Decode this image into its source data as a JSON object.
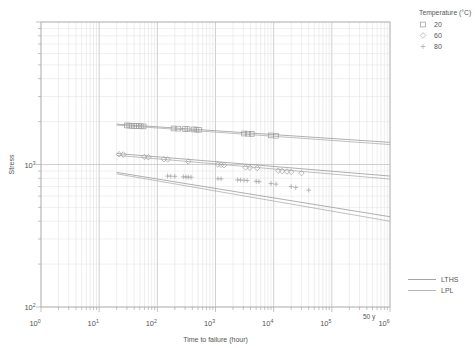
{
  "chart_data": {
    "type": "scatter",
    "title": "",
    "xlabel": "Time to failure (hour)",
    "ylabel": "Stress",
    "xscale": "log",
    "yscale": "log",
    "xlim": [
      1,
      1000000
    ],
    "ylim": [
      100,
      10000
    ],
    "xticks": [
      "10",
      "10",
      "10",
      "10",
      "10",
      "10",
      "10"
    ],
    "xtick_exponents": [
      "0",
      "1",
      "2",
      "3",
      "4",
      "5",
      "6"
    ],
    "yticks": [
      "10",
      "10"
    ],
    "ytick_exponents": [
      "2",
      "3"
    ],
    "grid": true,
    "legend_position": "top-right",
    "annotations": [
      {
        "text": "50 y",
        "x": 438000,
        "y": 100
      }
    ],
    "legend": {
      "title": "Temperature (°C)",
      "entries": [
        {
          "label": "20",
          "marker": "square",
          "color": "#9a9a9a"
        },
        {
          "label": "60",
          "marker": "diamond",
          "color": "#a8a8a8"
        },
        {
          "label": "80",
          "marker": "plus",
          "color": "#a8a8a8"
        }
      ]
    },
    "line_legend": {
      "entries": [
        {
          "label": "LTHS",
          "color": "#8e8e8e"
        },
        {
          "label": "LPL",
          "color": "#a5a5a5"
        }
      ]
    },
    "series": [
      {
        "name": "20",
        "marker": "square",
        "points": [
          [
            30,
            1880
          ],
          [
            33,
            1875
          ],
          [
            36,
            1870
          ],
          [
            40,
            1865
          ],
          [
            44,
            1862
          ],
          [
            48,
            1858
          ],
          [
            52,
            1855
          ],
          [
            58,
            1850
          ],
          [
            190,
            1790
          ],
          [
            230,
            1785
          ],
          [
            300,
            1775
          ],
          [
            330,
            1770
          ],
          [
            420,
            1762
          ],
          [
            470,
            1758
          ],
          [
            520,
            1752
          ],
          [
            3100,
            1650
          ],
          [
            3600,
            1645
          ],
          [
            4200,
            1640
          ],
          [
            9000,
            1600
          ],
          [
            11000,
            1592
          ]
        ]
      },
      {
        "name": "60",
        "marker": "diamond",
        "points": [
          [
            22,
            1180
          ],
          [
            26,
            1175
          ],
          [
            60,
            1130
          ],
          [
            70,
            1125
          ],
          [
            130,
            1090
          ],
          [
            150,
            1085
          ],
          [
            340,
            1050
          ],
          [
            1100,
            1000
          ],
          [
            1250,
            995
          ],
          [
            1400,
            990
          ],
          [
            3300,
            955
          ],
          [
            3900,
            950
          ],
          [
            5200,
            945
          ],
          [
            12000,
            905
          ],
          [
            14000,
            900
          ],
          [
            17000,
            893
          ],
          [
            20000,
            888
          ],
          [
            30000,
            870
          ]
        ]
      },
      {
        "name": "80",
        "marker": "plus",
        "points": [
          [
            150,
            830
          ],
          [
            170,
            828
          ],
          [
            200,
            826
          ],
          [
            280,
            820
          ],
          [
            310,
            818
          ],
          [
            340,
            816
          ],
          [
            380,
            814
          ],
          [
            1100,
            795
          ],
          [
            1250,
            793
          ],
          [
            2400,
            780
          ],
          [
            2700,
            778
          ],
          [
            3100,
            775
          ],
          [
            3500,
            772
          ],
          [
            5000,
            762
          ],
          [
            5600,
            758
          ],
          [
            9000,
            735
          ],
          [
            11000,
            728
          ],
          [
            20000,
            700
          ],
          [
            24000,
            690
          ],
          [
            40000,
            660
          ]
        ]
      }
    ],
    "fit_lines": [
      {
        "name": "LTHS-20",
        "kind": "LTHS",
        "from": [
          20,
          1920
        ],
        "to": [
          1000000,
          1430
        ]
      },
      {
        "name": "LTHS-60",
        "kind": "LTHS",
        "from": [
          20,
          1195
        ],
        "to": [
          1000000,
          830
        ]
      },
      {
        "name": "LTHS-80",
        "kind": "LTHS",
        "from": [
          20,
          880
        ],
        "to": [
          1000000,
          430
        ]
      },
      {
        "name": "LPL-20",
        "kind": "LPL",
        "from": [
          20,
          1890
        ],
        "to": [
          1000000,
          1380
        ]
      },
      {
        "name": "LPL-60",
        "kind": "LPL",
        "from": [
          20,
          1160
        ],
        "to": [
          1000000,
          790
        ]
      },
      {
        "name": "LPL-80",
        "kind": "LPL",
        "from": [
          20,
          860
        ],
        "to": [
          1000000,
          400
        ]
      }
    ]
  }
}
